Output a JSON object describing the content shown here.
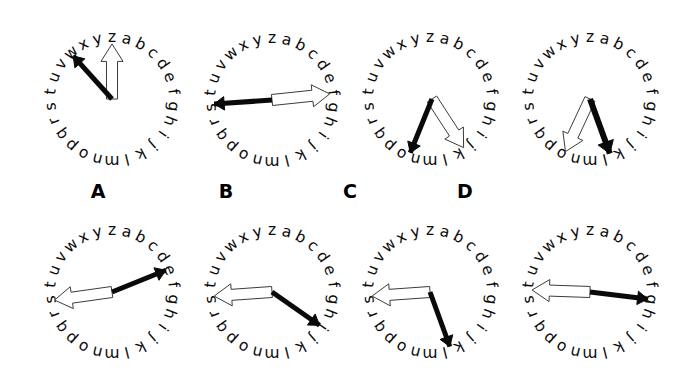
{
  "figure": {
    "title": "",
    "type": "clock-face-alphabet-dial-comparison",
    "background_color": "#ffffff",
    "letter_color": "#0a0a0a",
    "black_hand_color": "#0a0a0a",
    "white_hand_fill": "#ffffff",
    "white_hand_stroke": "#3c3c3c"
  },
  "dial": {
    "letters": [
      "z",
      "a",
      "b",
      "c",
      "d",
      "e",
      "f",
      "g",
      "h",
      "i",
      "j",
      "k",
      "l",
      "m",
      "n",
      "o",
      "p",
      "q",
      "r",
      "s",
      "t",
      "u",
      "v",
      "w",
      "x",
      "y"
    ],
    "count": 26,
    "start_position": "top",
    "direction": "clockwise"
  },
  "rows": [
    {
      "row_name": "top-row-stimuli",
      "clocks": [
        {
          "id": "clock-top-1",
          "label": "",
          "cx": 112,
          "cy": 99,
          "radius": 62,
          "black_hand": {
            "pointer_letter": "w",
            "angle_deg": 318,
            "length": 58,
            "width": 5
          },
          "white_hand": {
            "pointer_letter": "z",
            "angle_deg": 0,
            "length": 55,
            "width": 12
          }
        },
        {
          "id": "clock-top-2",
          "label": "",
          "cx": 272,
          "cy": 100,
          "radius": 62,
          "black_hand": {
            "pointer_letter": "t",
            "angle_deg": 266,
            "length": 58,
            "width": 5
          },
          "white_hand": {
            "pointer_letter": "f",
            "angle_deg": 84,
            "length": 58,
            "width": 12
          }
        },
        {
          "id": "clock-top-3",
          "label": "",
          "cx": 430,
          "cy": 99,
          "radius": 62,
          "origin_offset": {
            "x": 2,
            "y": 0
          },
          "black_hand": {
            "pointer_letter": "q",
            "angle_deg": 202,
            "length": 58,
            "width": 5
          },
          "white_hand": {
            "pointer_letter": "l",
            "angle_deg": 147,
            "length": 58,
            "width": 12
          }
        },
        {
          "id": "clock-top-4",
          "label": "",
          "cx": 590,
          "cy": 99,
          "radius": 62,
          "black_hand": {
            "pointer_letter": "m",
            "angle_deg": 160,
            "length": 58,
            "width": 6
          },
          "white_hand": {
            "pointer_letter": "p",
            "angle_deg": 205,
            "length": 58,
            "width": 12
          }
        }
      ]
    },
    {
      "row_name": "bottom-row-options",
      "clocks": [
        {
          "id": "clock-option-a",
          "label": "A",
          "label_x": 78,
          "label_y": 182,
          "cx": 112,
          "cy": 292,
          "radius": 62,
          "black_hand": {
            "pointer_letter": "e",
            "angle_deg": 68,
            "length": 58,
            "width": 5
          },
          "white_hand": {
            "pointer_letter": "u",
            "angle_deg": 262,
            "length": 58,
            "width": 12
          }
        },
        {
          "id": "clock-option-b",
          "label": "B",
          "label_x": 206,
          "label_y": 182,
          "cx": 272,
          "cy": 292,
          "radius": 62,
          "black_hand": {
            "pointer_letter": "j",
            "angle_deg": 125,
            "length": 58,
            "width": 5
          },
          "white_hand": {
            "pointer_letter": "u",
            "angle_deg": 266,
            "length": 58,
            "width": 12
          }
        },
        {
          "id": "clock-option-c",
          "label": "C",
          "label_x": 330,
          "label_y": 182,
          "cx": 430,
          "cy": 292,
          "radius": 62,
          "black_hand": {
            "pointer_letter": "l",
            "angle_deg": 160,
            "length": 58,
            "width": 5
          },
          "white_hand": {
            "pointer_letter": "u",
            "angle_deg": 266,
            "length": 58,
            "width": 12
          }
        },
        {
          "id": "clock-option-d",
          "label": "D",
          "label_x": 445,
          "label_y": 182,
          "cx": 590,
          "cy": 292,
          "radius": 62,
          "black_hand": {
            "pointer_letter": "h",
            "angle_deg": 97,
            "length": 58,
            "width": 5
          },
          "white_hand": {
            "pointer_letter": "u",
            "angle_deg": 272,
            "length": 58,
            "width": 12
          }
        }
      ]
    }
  ]
}
